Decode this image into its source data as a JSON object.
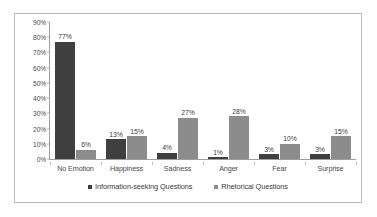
{
  "chart_data": {
    "type": "bar",
    "title": "",
    "subtitle": "",
    "xlabel": "",
    "ylabel": "",
    "categories": [
      "No Emotion",
      "Happiness",
      "Sadness",
      "Anger",
      "Fear",
      "Surprise"
    ],
    "series": [
      {
        "name": "Information-seeking Questions",
        "color": "#3f3f3f",
        "values": [
          77,
          13,
          4,
          1,
          3,
          3
        ],
        "labels": [
          "77%",
          "13%",
          "4%",
          "1%",
          "3%",
          "3%"
        ]
      },
      {
        "name": "Rhetorical Questions",
        "color": "#8c8c8c",
        "values": [
          6,
          15,
          27,
          28,
          10,
          15
        ],
        "labels": [
          "6%",
          "15%",
          "27%",
          "28%",
          "10%",
          "15%"
        ]
      }
    ],
    "ylim": [
      0,
      90
    ],
    "y_ticks": [
      0,
      10,
      20,
      30,
      40,
      50,
      60,
      70,
      80,
      90
    ],
    "y_tick_labels": [
      "0%",
      "10%",
      "20%",
      "30%",
      "40%",
      "50%",
      "60%",
      "70%",
      "80%",
      "90%"
    ],
    "grid": false,
    "legend_position": "bottom",
    "value_labels_shown": true
  },
  "legend": {
    "items": [
      {
        "label": "Information-seeking Questions",
        "color": "#3f3f3f"
      },
      {
        "label": "Rhetorical Questions",
        "color": "#8c8c8c"
      }
    ]
  },
  "colors": {
    "series0": "#3f3f3f",
    "series1": "#8c8c8c",
    "axis": "#9f9f9f",
    "frame_border": "#b9b9b9",
    "text": "#4a4a4a",
    "background": "#ffffff"
  }
}
